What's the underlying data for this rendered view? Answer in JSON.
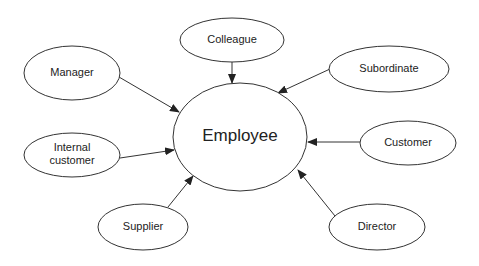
{
  "diagram": {
    "type": "stakeholder-map",
    "center": {
      "id": "employee",
      "label": "Employee",
      "cx": 240,
      "cy": 137,
      "rx": 67,
      "ry": 54
    },
    "nodes": [
      {
        "id": "colleague",
        "label": [
          "Colleague"
        ],
        "cx": 232,
        "cy": 40,
        "rx": 52,
        "ry": 22,
        "edge": {
          "from": [
            232,
            62
          ],
          "to": [
            232,
            83
          ]
        }
      },
      {
        "id": "manager",
        "label": [
          "Manager"
        ],
        "cx": 72,
        "cy": 73,
        "rx": 48,
        "ry": 27,
        "edge": {
          "from": [
            119,
            77
          ],
          "to": [
            179,
            112
          ]
        }
      },
      {
        "id": "subordinate",
        "label": [
          "Subordinate"
        ],
        "cx": 389,
        "cy": 69,
        "rx": 60,
        "ry": 23,
        "edge": {
          "from": [
            330,
            69
          ],
          "to": [
            278,
            93
          ]
        }
      },
      {
        "id": "internal-customer",
        "label": [
          "Internal",
          "customer"
        ],
        "cx": 72,
        "cy": 155,
        "rx": 48,
        "ry": 22,
        "edge": {
          "from": [
            120,
            158
          ],
          "to": [
            174,
            150
          ]
        }
      },
      {
        "id": "customer",
        "label": [
          "Customer"
        ],
        "cx": 408,
        "cy": 143,
        "rx": 48,
        "ry": 22,
        "edge": {
          "from": [
            360,
            142
          ],
          "to": [
            308,
            142
          ]
        }
      },
      {
        "id": "supplier",
        "label": [
          "Supplier"
        ],
        "cx": 143,
        "cy": 227,
        "rx": 45,
        "ry": 23,
        "edge": {
          "from": [
            168,
            207
          ],
          "to": [
            193,
            176
          ]
        }
      },
      {
        "id": "director",
        "label": [
          "Director"
        ],
        "cx": 377,
        "cy": 227,
        "rx": 48,
        "ry": 23,
        "edge": {
          "from": [
            335,
            216
          ],
          "to": [
            298,
            170
          ]
        }
      }
    ],
    "colors": {
      "stroke": "#333333",
      "fill": "#ffffff",
      "text": "#222222"
    }
  }
}
